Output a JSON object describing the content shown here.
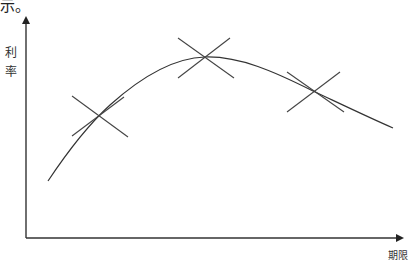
{
  "caption": "示。",
  "axes": {
    "ylabel": "利率",
    "ylabel_chars": [
      "利",
      "率"
    ],
    "xlabel": "期限"
  },
  "diagram": {
    "curve_color": "#333333",
    "markers": [
      {
        "name": "left",
        "x": 100,
        "y": 115
      },
      {
        "name": "peak",
        "x": 205,
        "y": 56
      },
      {
        "name": "right",
        "x": 313,
        "y": 92
      }
    ]
  }
}
